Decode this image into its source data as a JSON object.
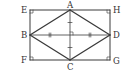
{
  "diagram": {
    "colors": {
      "line": "#3a3a3a",
      "text": "#333333",
      "background": "#ffffff"
    },
    "points": {
      "E": {
        "label": "E",
        "x": 30,
        "y": 10
      },
      "H": {
        "label": "H",
        "x": 110,
        "y": 10
      },
      "F": {
        "label": "F",
        "x": 30,
        "y": 60
      },
      "G": {
        "label": "G",
        "x": 110,
        "y": 60
      },
      "A": {
        "label": "A",
        "x": 70,
        "y": 10
      },
      "B": {
        "label": "B",
        "x": 30,
        "y": 35
      },
      "C": {
        "label": "C",
        "x": 70,
        "y": 60
      },
      "D": {
        "label": "D",
        "x": 110,
        "y": 35
      }
    },
    "labels": [
      {
        "name": "E",
        "text": "E"
      },
      {
        "name": "A",
        "text": "A"
      },
      {
        "name": "H",
        "text": "H"
      },
      {
        "name": "B",
        "text": "B"
      },
      {
        "name": "D",
        "text": "D"
      },
      {
        "name": "F",
        "text": "F"
      },
      {
        "name": "C",
        "text": "C"
      },
      {
        "name": "G",
        "text": "G"
      }
    ],
    "marks": {
      "right_angles": [
        "E",
        "H",
        "F",
        "G",
        "center"
      ],
      "equal_ticks": {
        "AC": "single",
        "BD": "double"
      }
    }
  }
}
